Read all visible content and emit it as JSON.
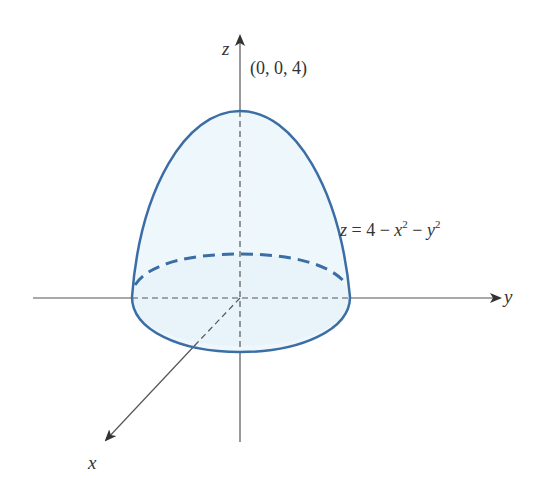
{
  "figure": {
    "type": "3D surface sketch",
    "surface": "paraboloid",
    "colors": {
      "surface_stroke": "#3a6ea5",
      "surface_fill": "#eef7fc",
      "axis": "#444444",
      "text": "#333333",
      "background": "#ffffff"
    }
  },
  "axes": {
    "x": {
      "label": "x"
    },
    "y": {
      "label": "y"
    },
    "z": {
      "label": "z"
    }
  },
  "annotations": {
    "apex_point": "(0, 0, 4)",
    "equation": {
      "lhs": "z",
      "eq": " = 4 − ",
      "x_var": "x",
      "x_exp": "2",
      "minus": " − ",
      "y_var": "y",
      "y_exp": "2"
    }
  }
}
